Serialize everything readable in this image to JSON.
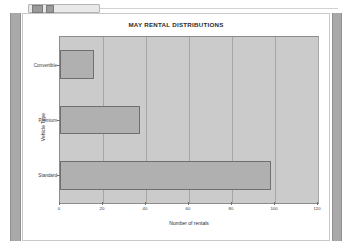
{
  "window": {
    "toolbar": {
      "buttons": [
        "minimize-button",
        "maximize-button"
      ]
    },
    "scrollbar_left": "vertical-scrollbar",
    "scrollbar_right": "vertical-scrollbar"
  },
  "chart_data": {
    "type": "bar",
    "orientation": "horizontal",
    "title": "MAY RENTAL DISTRIBUTIONS",
    "xlabel": "Number of rentals",
    "ylabel": "Vehicle Type",
    "categories": [
      "Standard",
      "Premium",
      "Convertible"
    ],
    "values": [
      98,
      37,
      16
    ],
    "xlim": [
      0,
      120
    ],
    "xticks": [
      0,
      20,
      40,
      60,
      80,
      100,
      120
    ],
    "xticklabels": [
      "0",
      "20",
      "40",
      "60",
      "80",
      "100",
      "120"
    ],
    "grid": "vertical",
    "legend": "none",
    "colors": {
      "plot_background": "#cbcbcb",
      "bar_fill": "#b0b0b0",
      "bar_edge": "#6f6f6f",
      "gridline": "#a6a6a6",
      "axis": "#8c8c8c",
      "text": "#2b2b2b",
      "figure_background": "#ffffff"
    }
  }
}
